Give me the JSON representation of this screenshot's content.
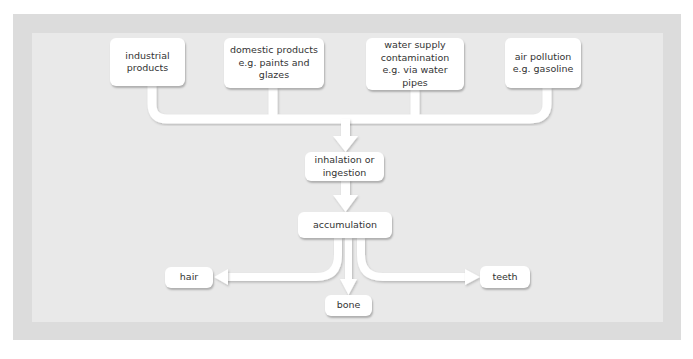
{
  "diagram": {
    "sources": [
      {
        "id": "industrial",
        "lines": [
          "industrial",
          "products"
        ]
      },
      {
        "id": "domestic",
        "lines": [
          "domestic products",
          "e.g. paints and glazes"
        ]
      },
      {
        "id": "water",
        "lines": [
          "water supply",
          "contamination",
          "e.g. via water pipes"
        ]
      },
      {
        "id": "air",
        "lines": [
          "air pollution",
          "e.g. gasoline"
        ]
      }
    ],
    "intake": {
      "lines": [
        "inhalation or",
        "ingestion"
      ]
    },
    "accumulation": {
      "label": "accumulation"
    },
    "targets": {
      "hair": "hair",
      "bone": "bone",
      "teeth": "teeth"
    },
    "colors": {
      "frame": "#dcdcdc",
      "panel": "#e9e9e9",
      "box": "#ffffff",
      "connector": "#ffffff",
      "text": "#333333"
    }
  }
}
